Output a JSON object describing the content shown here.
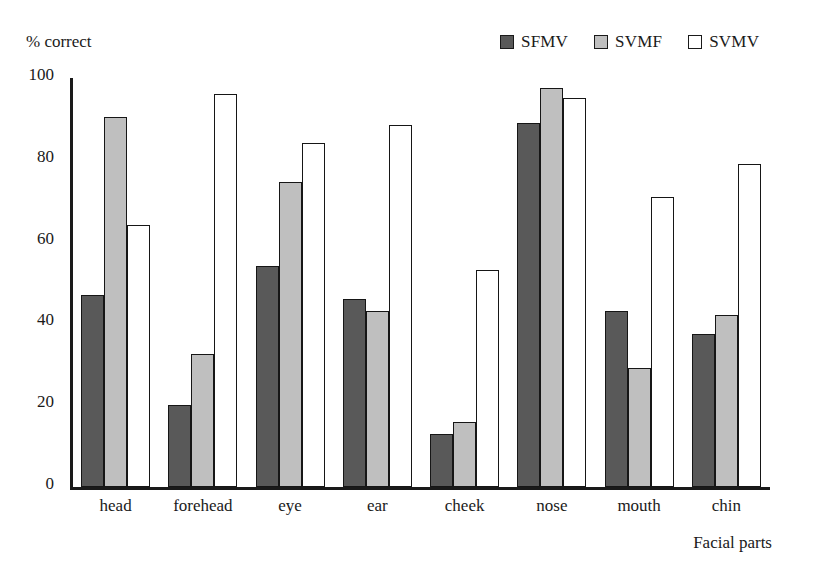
{
  "chart_data": {
    "type": "bar",
    "title": "",
    "xlabel": "Facial parts",
    "ylabel": "% correct",
    "ylim": [
      0,
      100
    ],
    "yticks": [
      0,
      20,
      40,
      60,
      80,
      100
    ],
    "grid": false,
    "legend_position": "top-right",
    "categories": [
      "head",
      "forehead",
      "eye",
      "ear",
      "cheek",
      "nose",
      "mouth",
      "chin"
    ],
    "series": [
      {
        "name": "SFMV",
        "color": "#595959",
        "values": [
          47,
          20,
          54,
          46,
          13,
          89,
          43,
          37.5
        ]
      },
      {
        "name": "SVMF",
        "color": "#bfbfbf",
        "values": [
          90.5,
          32.5,
          74.5,
          43,
          16,
          97.5,
          29,
          42
        ]
      },
      {
        "name": "SVMV",
        "color": "#ffffff",
        "values": [
          64,
          96,
          84,
          88.5,
          53,
          95,
          71,
          79
        ]
      }
    ]
  },
  "axis": {
    "y_title": "% correct",
    "x_title": "Facial parts",
    "tick_labels": [
      "0",
      "20",
      "40",
      "60",
      "80",
      "100"
    ]
  },
  "legend": {
    "items": [
      {
        "label": "SFMV",
        "swatch": "#595959"
      },
      {
        "label": "SVMF",
        "swatch": "#bfbfbf"
      },
      {
        "label": "SVMV",
        "swatch": "#ffffff"
      }
    ]
  },
  "colors": {
    "axis": "#1a1a1a",
    "bar_outline": "#161616",
    "background": "#ffffff",
    "series_dark": "#595959",
    "series_light": "#bfbfbf",
    "series_white": "#ffffff"
  }
}
